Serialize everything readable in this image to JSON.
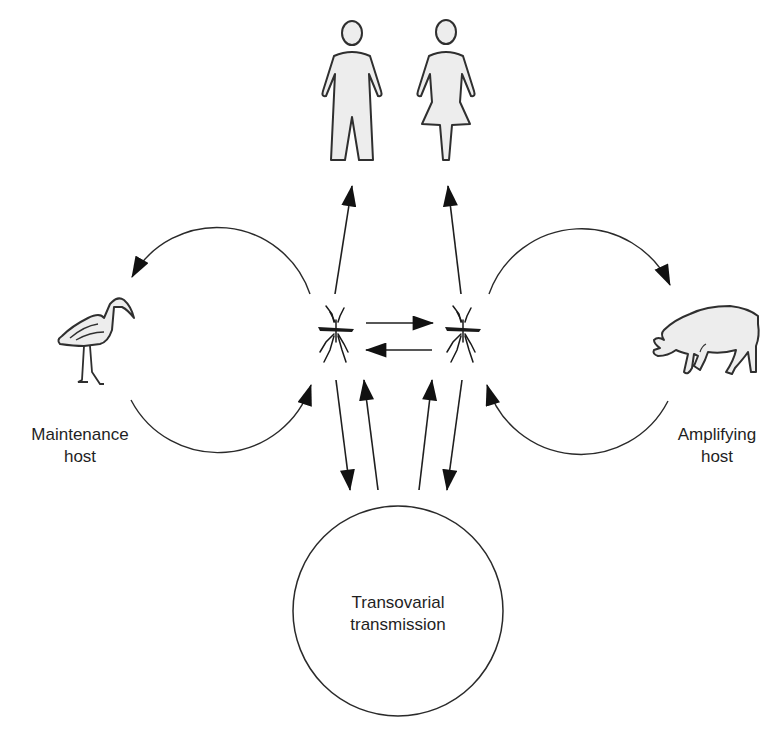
{
  "diagram": {
    "title": "",
    "type": "transmission-cycle",
    "nodes": {
      "human_male": {
        "label": "",
        "icon": "human-male-icon"
      },
      "human_female": {
        "label": "",
        "icon": "human-female-icon"
      },
      "maintenance_host": {
        "label_line1": "Maintenance",
        "label_line2": "host",
        "icon": "wading-bird-icon"
      },
      "amplifying_host": {
        "label_line1": "Amplifying",
        "label_line2": "host",
        "icon": "pig-icon"
      },
      "vector_left": {
        "label": "",
        "icon": "mosquito-icon"
      },
      "vector_right": {
        "label": "",
        "icon": "mosquito-icon"
      },
      "transovarial": {
        "label_line1": "Transovarial",
        "label_line2": "transmission"
      }
    },
    "edges": [
      {
        "from": "vector_left",
        "to": "human_male",
        "kind": "one-way"
      },
      {
        "from": "vector_right",
        "to": "human_female",
        "kind": "one-way"
      },
      {
        "from": "vector_left",
        "to": "vector_right",
        "kind": "arrow"
      },
      {
        "from": "vector_right",
        "to": "vector_left",
        "kind": "arrow"
      },
      {
        "from": "vector_left",
        "to": "maintenance_host",
        "kind": "cycle-arc"
      },
      {
        "from": "maintenance_host",
        "to": "vector_left",
        "kind": "cycle-arc"
      },
      {
        "from": "vector_right",
        "to": "amplifying_host",
        "kind": "cycle-arc"
      },
      {
        "from": "amplifying_host",
        "to": "vector_right",
        "kind": "cycle-arc"
      },
      {
        "from": "vector_left",
        "to": "transovarial",
        "kind": "arrow"
      },
      {
        "from": "transovarial",
        "to": "vector_left",
        "kind": "arrow"
      },
      {
        "from": "transovarial",
        "to": "vector_right",
        "kind": "arrow"
      },
      {
        "from": "vector_right",
        "to": "transovarial",
        "kind": "arrow"
      }
    ],
    "colors": {
      "line": "#1f1f1f",
      "figure_fill": "#ededed",
      "background": "#ffffff"
    }
  }
}
